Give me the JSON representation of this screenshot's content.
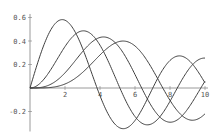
{
  "chart_data": {
    "type": "line",
    "title": "",
    "xlabel": "",
    "ylabel": "",
    "xlim": [
      0,
      10
    ],
    "ylim": [
      -0.37,
      0.63
    ],
    "grid": false,
    "legend": null,
    "x_ticks": [
      2,
      4,
      6,
      8,
      10
    ],
    "x_tick_labels": [
      "2",
      "4",
      "6",
      "8",
      "10"
    ],
    "y_ticks": [
      -0.2,
      0.2,
      0.4,
      0.6
    ],
    "y_tick_labels": [
      "-0.2",
      "0.2",
      "0.4",
      "0.6"
    ],
    "series": [
      {
        "name": "BesselJ[1,x]",
        "order": 1,
        "x": [
          0,
          1,
          2,
          3,
          4,
          5,
          6,
          7,
          8,
          9,
          10
        ],
        "values": [
          0,
          0.44,
          0.577,
          0.339,
          -0.066,
          -0.328,
          -0.277,
          -0.005,
          0.235,
          0.245,
          0.043
        ]
      },
      {
        "name": "BesselJ[2,x]",
        "order": 2,
        "x": [
          0,
          1,
          2,
          3,
          4,
          5,
          6,
          7,
          8,
          9,
          10
        ],
        "values": [
          0,
          0.115,
          0.353,
          0.486,
          0.364,
          0.047,
          -0.243,
          -0.301,
          -0.113,
          0.145,
          0.255
        ]
      },
      {
        "name": "BesselJ[3,x]",
        "order": 3,
        "x": [
          0,
          1,
          2,
          3,
          4,
          5,
          6,
          7,
          8,
          9,
          10
        ],
        "values": [
          0,
          0.02,
          0.129,
          0.309,
          0.43,
          0.365,
          0.115,
          -0.168,
          -0.291,
          -0.181,
          0.058
        ]
      },
      {
        "name": "BesselJ[4,x]",
        "order": 4,
        "x": [
          0,
          1,
          2,
          3,
          4,
          5,
          6,
          7,
          8,
          9,
          10
        ],
        "values": [
          0,
          0.002,
          0.034,
          0.132,
          0.281,
          0.391,
          0.358,
          0.158,
          -0.105,
          -0.265,
          -0.22
        ]
      }
    ],
    "colors": {
      "line": "#404040",
      "axis": "#808080",
      "text": "#555555"
    }
  }
}
